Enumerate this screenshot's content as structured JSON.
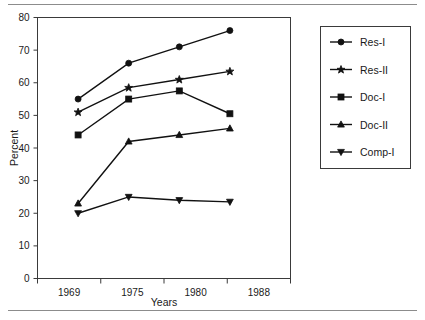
{
  "chart_data": {
    "type": "line",
    "title": "",
    "xlabel": "Years",
    "ylabel": "Percent",
    "categories": [
      "1969",
      "1975",
      "1980",
      "1988"
    ],
    "x": [
      1969,
      1975,
      1980,
      1988
    ],
    "xlim": [
      1966,
      1991
    ],
    "ylim": [
      0,
      80
    ],
    "ytick_labels": [
      "0",
      "10",
      "20",
      "30",
      "40",
      "50",
      "60",
      "70",
      "80"
    ],
    "ytick_values": [
      0,
      10,
      20,
      30,
      40,
      50,
      60,
      70,
      80
    ],
    "xtick_labels": [
      "1969",
      "1975",
      "1980",
      "1988"
    ],
    "grid": false,
    "legend_position": "right-outside",
    "series": [
      {
        "name": "Res-I",
        "marker": "circle",
        "values": [
          55,
          66,
          71,
          76
        ]
      },
      {
        "name": "Res-II",
        "marker": "star",
        "values": [
          51,
          58.5,
          61,
          63.5
        ]
      },
      {
        "name": "Doc-I",
        "marker": "square",
        "values": [
          44,
          55,
          57.5,
          50.5
        ]
      },
      {
        "name": "Doc-II",
        "marker": "triangle-up",
        "values": [
          23,
          42,
          44,
          46
        ]
      },
      {
        "name": "Comp-I",
        "marker": "triangle-down",
        "values": [
          20,
          25,
          24,
          23.5
        ]
      }
    ]
  },
  "axes": {
    "y_title": "Percent",
    "x_title": "Years"
  },
  "legend": {
    "entries": [
      {
        "label": "Res-I"
      },
      {
        "label": "Res-II"
      },
      {
        "label": "Doc-I"
      },
      {
        "label": "Doc-II"
      },
      {
        "label": "Comp-I"
      }
    ]
  },
  "colors": {
    "ink": "#111111",
    "axis": "#3a3a3a",
    "rule": "#8c8c8c",
    "background": "#ffffff"
  }
}
